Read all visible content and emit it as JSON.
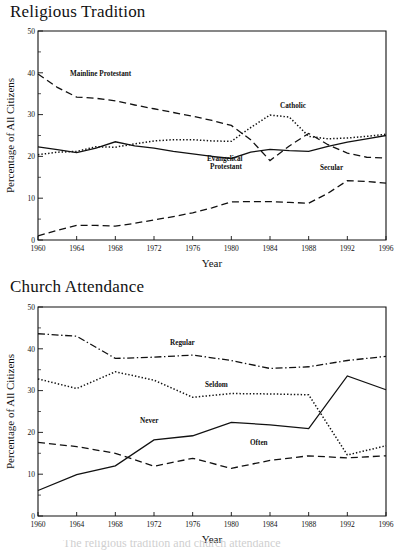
{
  "page": {
    "background_color": "#ffffff",
    "ink_color": "#111111",
    "width": 400,
    "height": 551
  },
  "caption": {
    "text": "The religious tradition and church attendance"
  },
  "charts": [
    {
      "id": "religious-tradition",
      "title": "Religious Tradition",
      "xlabel": "Year",
      "ylabel": "Percentage of All Citizens",
      "xlim": [
        1960,
        1996
      ],
      "ylim": [
        0,
        50
      ],
      "xticks": [
        1960,
        1964,
        1968,
        1972,
        1976,
        1980,
        1984,
        1988,
        1992,
        1996
      ],
      "yticks": [
        0,
        10,
        20,
        30,
        40,
        50
      ],
      "yticks_minor": [
        5,
        15,
        25,
        35,
        45
      ],
      "grid": false,
      "legend_position": "inline-annotations",
      "chart_data": {
        "type": "line",
        "title": "Religious Tradition",
        "xlabel": "Year",
        "ylabel": "Percentage of All Citizens",
        "xlim": [
          1960,
          1996
        ],
        "ylim": [
          0,
          50
        ],
        "x": [
          1960,
          1962,
          1964,
          1966,
          1968,
          1970,
          1972,
          1974,
          1976,
          1978,
          1980,
          1982,
          1984,
          1986,
          1988,
          1990,
          1992,
          1994,
          1996
        ],
        "series": [
          {
            "name": "Mainline Protestant",
            "style": "long-dash",
            "values": [
              39.7,
              36.5,
              34.2,
              33.9,
              33.3,
              32.3,
              31.4,
              30.5,
              29.6,
              28.6,
              27.4,
              24.0,
              19.0,
              22.5,
              25.5,
              22.8,
              20.8,
              19.8,
              19.6
            ]
          },
          {
            "name": "Catholic",
            "style": "dotted",
            "values": [
              20.4,
              21.0,
              21.2,
              22.3,
              22.2,
              23.0,
              23.7,
              24.0,
              24.0,
              23.7,
              23.6,
              26.9,
              29.9,
              29.4,
              24.8,
              24.2,
              24.4,
              24.8,
              25.3
            ]
          },
          {
            "name": "Evangelical Protestant",
            "style": "solid",
            "values": [
              22.3,
              21.6,
              20.9,
              22.0,
              23.5,
              22.5,
              22.0,
              21.2,
              20.6,
              20.0,
              19.5,
              21.0,
              21.7,
              21.4,
              21.2,
              22.4,
              23.4,
              24.2,
              25.0
            ]
          },
          {
            "name": "Secular",
            "style": "long-dash",
            "values": [
              1.0,
              2.3,
              3.5,
              3.5,
              3.3,
              4.0,
              4.8,
              5.6,
              6.5,
              7.7,
              9.1,
              9.2,
              9.2,
              9.0,
              8.8,
              11.2,
              14.2,
              14.0,
              13.6
            ]
          }
        ],
        "annotations": [
          {
            "label": "Mainline Protestant",
            "x_px": 70,
            "y_px": 76
          },
          {
            "label": "Catholic",
            "x_px": 280,
            "y_px": 108
          },
          {
            "label": "Evangelical",
            "x_px": 207,
            "y_px": 161
          },
          {
            "label": "Protestant",
            "x_px": 210,
            "y_px": 169
          },
          {
            "label": "Secular",
            "x_px": 320,
            "y_px": 170
          }
        ]
      }
    },
    {
      "id": "church-attendance",
      "title": "Church Attendance",
      "xlabel": "Year",
      "ylabel": "Percentage of All Citizens",
      "xlim": [
        1960,
        1996
      ],
      "ylim": [
        0,
        50
      ],
      "xticks": [
        1960,
        1964,
        1968,
        1972,
        1976,
        1980,
        1984,
        1988,
        1992,
        1996
      ],
      "yticks": [
        0,
        10,
        20,
        30,
        40,
        50
      ],
      "yticks_minor": [
        5,
        15,
        25,
        35,
        45
      ],
      "grid": false,
      "legend_position": "inline-annotations",
      "chart_data": {
        "type": "line",
        "title": "Church Attendance",
        "xlabel": "Year",
        "ylabel": "Percentage of All Citizens",
        "xlim": [
          1960,
          1996
        ],
        "ylim": [
          0,
          50
        ],
        "x": [
          1960,
          1964,
          1968,
          1972,
          1976,
          1980,
          1984,
          1988,
          1992,
          1996
        ],
        "series": [
          {
            "name": "Regular",
            "style": "dash-dot",
            "values": [
              43.6,
              43.0,
              37.7,
              38.0,
              38.5,
              37.2,
              35.3,
              35.7,
              37.2,
              38.2
            ]
          },
          {
            "name": "Seldom",
            "style": "dotted",
            "values": [
              32.8,
              30.5,
              34.5,
              32.5,
              28.4,
              29.3,
              29.2,
              29.0,
              14.6,
              16.8
            ]
          },
          {
            "name": "Never",
            "style": "solid",
            "values": [
              6.1,
              9.9,
              12.0,
              18.2,
              19.2,
              22.4,
              21.8,
              20.9,
              33.5,
              30.2
            ]
          },
          {
            "name": "Often",
            "style": "long-dash",
            "values": [
              17.6,
              16.6,
              15.0,
              11.9,
              13.8,
              11.4,
              13.3,
              14.4,
              13.9,
              14.4
            ]
          }
        ],
        "annotations": [
          {
            "label": "Regular",
            "x_px": 170,
            "y_px": 345
          },
          {
            "label": "Seldom",
            "x_px": 205,
            "y_px": 387
          },
          {
            "label": "Never",
            "x_px": 140,
            "y_px": 423
          },
          {
            "label": "Often",
            "x_px": 250,
            "y_px": 445
          }
        ]
      }
    }
  ]
}
